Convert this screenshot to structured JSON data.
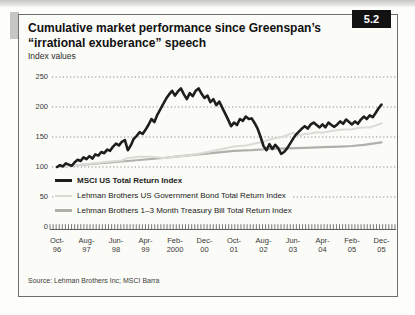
{
  "header": {
    "title": "Cumulative market performance since Greenspan’s “irrational exuberance” speech",
    "badge": "5.2",
    "subtitle": "Index values"
  },
  "source": "Source: Lehman Brothers Inc; MSCI Barra",
  "chart_data": {
    "type": "line",
    "title": "Cumulative market performance since Greenspan’s “irrational exuberance” speech",
    "ylabel": "Index values",
    "ylim": [
      0,
      250
    ],
    "yticks": [
      250,
      200,
      150,
      100,
      50,
      0
    ],
    "grid": "dotted horizontal lines at each y tick; dense monthly tick comb along zero baseline",
    "legend_position": "inside plot, lower left",
    "x_unit": "months since Oct-1996",
    "categories": [
      "Oct-96",
      "Aug-97",
      "Jun-98",
      "Apr-99",
      "Feb-2000",
      "Dec-00",
      "Oct-01",
      "Aug-02",
      "Jun-03",
      "Apr-04",
      "Feb-05",
      "Dec-05"
    ],
    "category_positions_months": [
      0,
      10,
      20,
      30,
      40,
      50,
      60,
      70,
      80,
      90,
      100,
      110
    ],
    "series": [
      {
        "name": "MSCI US Total Return Index",
        "color": "#1e1e1c",
        "stroke_width": 2.6,
        "points": [
          [
            0,
            100
          ],
          [
            1,
            103
          ],
          [
            2,
            101
          ],
          [
            3,
            106
          ],
          [
            4,
            104
          ],
          [
            5,
            102
          ],
          [
            6,
            108
          ],
          [
            7,
            112
          ],
          [
            8,
            110
          ],
          [
            9,
            116
          ],
          [
            10,
            113
          ],
          [
            11,
            118
          ],
          [
            12,
            114
          ],
          [
            13,
            121
          ],
          [
            14,
            119
          ],
          [
            15,
            125
          ],
          [
            16,
            123
          ],
          [
            17,
            129
          ],
          [
            18,
            127
          ],
          [
            19,
            134
          ],
          [
            20,
            139
          ],
          [
            21,
            136
          ],
          [
            22,
            142
          ],
          [
            23,
            145
          ],
          [
            24,
            128
          ],
          [
            25,
            136
          ],
          [
            26,
            147
          ],
          [
            27,
            152
          ],
          [
            28,
            158
          ],
          [
            29,
            155
          ],
          [
            30,
            162
          ],
          [
            31,
            170
          ],
          [
            32,
            180
          ],
          [
            33,
            175
          ],
          [
            34,
            187
          ],
          [
            35,
            196
          ],
          [
            36,
            205
          ],
          [
            37,
            214
          ],
          [
            38,
            221
          ],
          [
            39,
            227
          ],
          [
            40,
            219
          ],
          [
            41,
            226
          ],
          [
            42,
            231
          ],
          [
            43,
            221
          ],
          [
            44,
            213
          ],
          [
            45,
            223
          ],
          [
            46,
            218
          ],
          [
            47,
            227
          ],
          [
            48,
            231
          ],
          [
            49,
            222
          ],
          [
            50,
            215
          ],
          [
            51,
            219
          ],
          [
            52,
            208
          ],
          [
            53,
            213
          ],
          [
            54,
            203
          ],
          [
            55,
            209
          ],
          [
            56,
            199
          ],
          [
            57,
            189
          ],
          [
            58,
            179
          ],
          [
            59,
            168
          ],
          [
            60,
            174
          ],
          [
            61,
            170
          ],
          [
            62,
            180
          ],
          [
            63,
            177
          ],
          [
            64,
            184
          ],
          [
            65,
            180
          ],
          [
            66,
            181
          ],
          [
            67,
            173
          ],
          [
            68,
            164
          ],
          [
            69,
            150
          ],
          [
            70,
            135
          ],
          [
            71,
            128
          ],
          [
            72,
            138
          ],
          [
            73,
            130
          ],
          [
            74,
            137
          ],
          [
            75,
            131
          ],
          [
            76,
            122
          ],
          [
            77,
            125
          ],
          [
            78,
            131
          ],
          [
            79,
            139
          ],
          [
            80,
            147
          ],
          [
            81,
            154
          ],
          [
            82,
            159
          ],
          [
            83,
            164
          ],
          [
            84,
            168
          ],
          [
            85,
            164
          ],
          [
            86,
            171
          ],
          [
            87,
            174
          ],
          [
            88,
            170
          ],
          [
            89,
            166
          ],
          [
            90,
            171
          ],
          [
            91,
            166
          ],
          [
            92,
            174
          ],
          [
            93,
            170
          ],
          [
            94,
            167
          ],
          [
            95,
            171
          ],
          [
            96,
            176
          ],
          [
            97,
            172
          ],
          [
            98,
            179
          ],
          [
            99,
            175
          ],
          [
            100,
            171
          ],
          [
            101,
            176
          ],
          [
            102,
            172
          ],
          [
            103,
            179
          ],
          [
            104,
            184
          ],
          [
            105,
            180
          ],
          [
            106,
            186
          ],
          [
            107,
            183
          ],
          [
            108,
            190
          ],
          [
            109,
            198
          ],
          [
            110,
            204
          ]
        ]
      },
      {
        "name": "Lehman Brothers US Government Bond Total Return Index",
        "color": "#dbdbd5",
        "stroke_width": 2.0,
        "points": [
          [
            0,
            100
          ],
          [
            6,
            103
          ],
          [
            12,
            106
          ],
          [
            18,
            109
          ],
          [
            22,
            111
          ],
          [
            24,
            115
          ],
          [
            28,
            117
          ],
          [
            32,
            117
          ],
          [
            36,
            115
          ],
          [
            40,
            117
          ],
          [
            44,
            119
          ],
          [
            48,
            122
          ],
          [
            52,
            126
          ],
          [
            56,
            130
          ],
          [
            60,
            134
          ],
          [
            64,
            136
          ],
          [
            66,
            138
          ],
          [
            70,
            142
          ],
          [
            72,
            146
          ],
          [
            74,
            148
          ],
          [
            76,
            150
          ],
          [
            78,
            153
          ],
          [
            80,
            157
          ],
          [
            82,
            153
          ],
          [
            84,
            155
          ],
          [
            86,
            156
          ],
          [
            88,
            158
          ],
          [
            90,
            157
          ],
          [
            92,
            159
          ],
          [
            96,
            162
          ],
          [
            100,
            163
          ],
          [
            102,
            165
          ],
          [
            104,
            166
          ],
          [
            106,
            166
          ],
          [
            108,
            169
          ],
          [
            110,
            173
          ]
        ]
      },
      {
        "name": "Lehman Brothers 1–3 Month Treasury Bill Total Return Index",
        "color": "#b0b0ab",
        "stroke_width": 2.2,
        "points": [
          [
            0,
            100
          ],
          [
            12,
            105
          ],
          [
            24,
            110
          ],
          [
            36,
            115
          ],
          [
            42,
            118
          ],
          [
            48,
            121
          ],
          [
            54,
            124
          ],
          [
            60,
            127
          ],
          [
            66,
            128
          ],
          [
            72,
            130
          ],
          [
            78,
            131
          ],
          [
            84,
            132
          ],
          [
            90,
            133
          ],
          [
            96,
            134
          ],
          [
            100,
            135
          ],
          [
            104,
            137
          ],
          [
            107,
            139
          ],
          [
            110,
            141
          ]
        ]
      }
    ]
  }
}
